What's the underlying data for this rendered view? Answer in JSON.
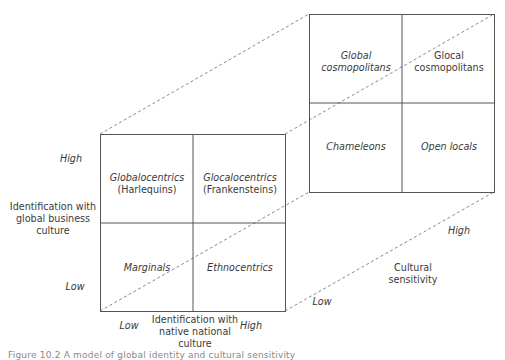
{
  "diagram": {
    "front_matrix": {
      "cells": {
        "top_left": {
          "line1": "Globalocentrics",
          "line2": "(Harlequins)"
        },
        "top_right": {
          "line1": "Glocalocentrics",
          "line2": "(Frankensteins)"
        },
        "bottom_left": {
          "line1": "Marginals"
        },
        "bottom_right": {
          "line1": "Ethnocentrics"
        }
      },
      "y_axis": {
        "title_line1": "Identification with",
        "title_line2": "global business",
        "title_line3": "culture",
        "high": "High",
        "low": "Low"
      },
      "x_axis": {
        "title_line1": "Identification with",
        "title_line2": "native national",
        "title_line3": "culture",
        "low": "Low",
        "high": "High"
      }
    },
    "back_matrix": {
      "cells": {
        "top_left": {
          "line1": "Global",
          "line2": "cosmopolitans"
        },
        "top_right": {
          "line1": "Glocal",
          "line2": "cosmopolitans"
        },
        "bottom_left": {
          "line1": "Chameleons"
        },
        "bottom_right": {
          "line1": "Open locals"
        }
      }
    },
    "z_axis": {
      "title_line1": "Cultural",
      "title_line2": "sensitivity",
      "low": "Low",
      "high": "High"
    },
    "caption": "Figure 10.2  A model of global identity and cultural sensitivity"
  },
  "colors": {
    "line": "#555555",
    "dashed": "#8a8a8a",
    "text": "#3a3a3a"
  }
}
